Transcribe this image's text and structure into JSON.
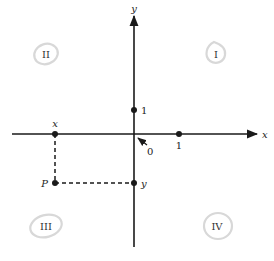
{
  "diagram": {
    "type": "cartesian-plane",
    "axes": {
      "x_label": "x",
      "y_label": "y",
      "origin_label": "0"
    },
    "unit_marks": {
      "x_unit_label": "1",
      "y_unit_label": "1"
    },
    "point": {
      "name": "P",
      "x_projection_label": "x",
      "y_projection_label": "y"
    },
    "quadrants": {
      "I": "I",
      "II": "II",
      "III": "III",
      "IV": "IV"
    },
    "colors": {
      "axis": "#1a1a1a",
      "annotation_ring": "#d8d8d8",
      "background": "#ffffff"
    }
  }
}
